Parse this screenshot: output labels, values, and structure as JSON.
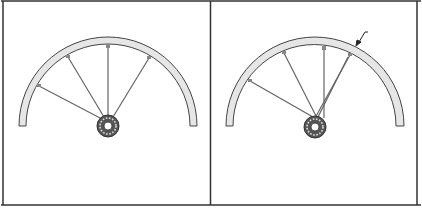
{
  "diagram": {
    "title": "",
    "panels": [
      {
        "id": "left",
        "description": "Half bicycle wheel rim with five spokes converging on hub",
        "spokes": 5,
        "arrow": false
      },
      {
        "id": "right",
        "description": "Half bicycle wheel rim with five spokes, one crossing, arrow pointing at rim",
        "spokes": 5,
        "arrow": true
      }
    ],
    "colors": {
      "border": "#333333",
      "rim_fill": "#e6e6e6",
      "rim_stroke": "#444444",
      "spoke": "#666666",
      "hub_fill": "#555555",
      "background": "#ffffff"
    }
  }
}
